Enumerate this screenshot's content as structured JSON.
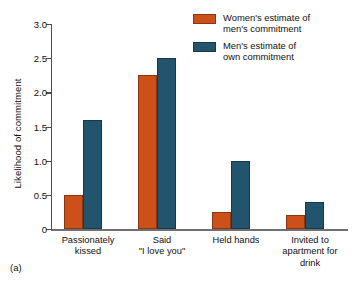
{
  "figure": {
    "panel_caption": "(a)"
  },
  "legend": {
    "position": "top-right",
    "entries": [
      {
        "label": "Women's estimate of\nmen's commitment",
        "color": "#cc5119",
        "swatch_name": "legend-swatch-women"
      },
      {
        "label": "Men's estimate of\nown commitment",
        "color": "#22546e",
        "swatch_name": "legend-swatch-men"
      }
    ]
  },
  "chart_data": {
    "type": "bar",
    "title": "",
    "subtitle": "",
    "xlabel": "",
    "ylabel": "Likelihood of commitment",
    "ylim": [
      0,
      3.0
    ],
    "yticks": [
      "0",
      "0.5",
      "1.0",
      "1.5",
      "2.0",
      "2.5",
      "3.0"
    ],
    "ytick_values": [
      0,
      0.5,
      1.0,
      1.5,
      2.0,
      2.5,
      3.0
    ],
    "grid": false,
    "categories": [
      "Passionately\nkissed",
      "Said\n\"I love you\"",
      "Held hands",
      "Invited to\napartment for\ndrink"
    ],
    "series": [
      {
        "name": "Women's estimate of men's commitment",
        "color": "#cc5119",
        "values": [
          0.5,
          2.25,
          0.25,
          0.2
        ]
      },
      {
        "name": "Men's estimate of own commitment",
        "color": "#22546e",
        "values": [
          1.6,
          2.5,
          1.0,
          0.4
        ]
      }
    ]
  }
}
